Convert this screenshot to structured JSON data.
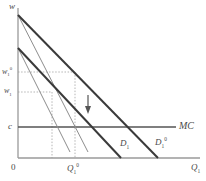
{
  "figure": {
    "kind": "economics-demand-shift-diagram",
    "width": 206,
    "height": 181,
    "background": "#ffffff"
  },
  "axes": {
    "y_label": "w",
    "x_label_base": "Q",
    "x_label_sub": "1",
    "origin_label": "0",
    "axis_color": "#9a9a9a",
    "x_axis_y": 158,
    "y_axis_x": 18,
    "x_axis_x_end": 200,
    "y_axis_y_top": 8
  },
  "value_labels": {
    "w_high_base": "w",
    "w_high_sub": "1",
    "w_high_sup": "0",
    "w_low_base": "w",
    "w_low_sub": "1",
    "cost_label": "c",
    "q_base": "Q",
    "q_sub": "1",
    "q_sup": "0"
  },
  "curves": [
    {
      "name": "demand-initial",
      "label_base": "D",
      "label_sub": "1",
      "label_sup": "0",
      "color": "#3a3a3a",
      "width": 2.0,
      "x1": 18,
      "y1": 15,
      "x2": 158,
      "y2": 158
    },
    {
      "name": "demand-shifted",
      "label_base": "D",
      "label_sub": "1",
      "label_sup": "",
      "color": "#3a3a3a",
      "width": 2.0,
      "x1": 18,
      "y1": 48,
      "x2": 121,
      "y2": 158
    },
    {
      "name": "marginal-revenue-initial",
      "color": "#8d8d8d",
      "width": 1.0,
      "x1": 18,
      "y1": 15,
      "x2": 88,
      "y2": 152
    },
    {
      "name": "marginal-revenue-shifted",
      "color": "#8d8d8d",
      "width": 1.0,
      "x1": 18,
      "y1": 48,
      "x2": 70,
      "y2": 152
    }
  ],
  "mc_line": {
    "name": "marginal-cost",
    "label": "MC",
    "color": "#555555",
    "width": 1.6,
    "y": 127,
    "x1": 18,
    "x2": 176
  },
  "guides": {
    "color": "#b5b5b5",
    "dash": "1.5,1.6",
    "horizontal": [
      {
        "name": "w-high-guide",
        "y": 72,
        "x1": 18,
        "x2": 75
      },
      {
        "name": "w-low-guide",
        "y": 92,
        "x1": 18,
        "x2": 52
      }
    ],
    "vertical": [
      {
        "name": "q-shifted-guide",
        "x": 52,
        "y1": 92,
        "y2": 158
      },
      {
        "name": "q-initial-guide",
        "x": 75,
        "y1": 72,
        "y2": 158
      }
    ]
  },
  "shift_arrow": {
    "name": "downward-shift-arrow",
    "color": "#555555",
    "x": 88,
    "y_top": 95,
    "y_bottom": 113
  }
}
